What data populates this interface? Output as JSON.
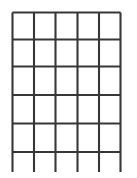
{
  "figure": {
    "type": "line-drawing",
    "canvas": {
      "width": 137,
      "height": 178,
      "background_color": "#ffffff"
    },
    "stroke": {
      "color": "#373737",
      "width": 2.1,
      "units": "px"
    },
    "grid": {
      "columns": 5,
      "rows": 5,
      "vertical_line_count": 6,
      "horizontal_line_count": 6,
      "cell_count": 25,
      "vertical_x_positions": [
        12.5,
        34,
        55.5,
        77.5,
        99,
        120.5
      ],
      "horizontal_y_positions": [
        12.5,
        39.5,
        66.5,
        95,
        123.5,
        152
      ],
      "vertical_top_y": 12.5,
      "vertical_bottom_y": 172,
      "horizontal_left_x": 12.5,
      "horizontal_right_x": 120.5,
      "leg_extension_px": 20,
      "description": "Five-by-five rectangular lattice of dark gray lines with vertical members extending below the lowest horizontal member"
    }
  },
  "chart_data": {
    "type": "table",
    "xlabel": "",
    "ylabel": "",
    "columns": 5,
    "rows": 5,
    "grid": true,
    "legend": "none",
    "x": [
      12.5,
      34,
      55.5,
      77.5,
      99,
      120.5
    ],
    "y": [
      12.5,
      39.5,
      66.5,
      95,
      123.5,
      152
    ],
    "series": [
      {
        "name": "vertical-members",
        "orientation": "vertical",
        "values": [
          12.5,
          34,
          55.5,
          77.5,
          99,
          120.5
        ],
        "span_start": 12.5,
        "span_end": 172
      },
      {
        "name": "horizontal-members",
        "orientation": "horizontal",
        "values": [
          12.5,
          39.5,
          66.5,
          95,
          123.5,
          152
        ],
        "span_start": 12.5,
        "span_end": 120.5
      }
    ],
    "annotations": []
  }
}
